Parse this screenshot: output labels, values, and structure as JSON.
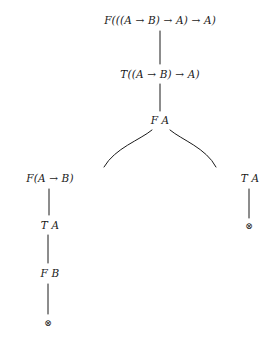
{
  "diagram": {
    "kind": "semantic-tableau-proof-tree",
    "background_color": "#ffffff",
    "line_color": "#1a1a1a",
    "text_color": "#1a1a1a",
    "closure_symbol": "⊗",
    "arrow_symbol": "→",
    "nodes": [
      {
        "id": "n1",
        "label": "F(((A → B) → A) → A)",
        "x": 160,
        "y": 20,
        "type": "formula"
      },
      {
        "id": "n2",
        "label": "T((A → B) → A)",
        "x": 160,
        "y": 74,
        "type": "formula"
      },
      {
        "id": "n3",
        "label": "F A",
        "x": 160,
        "y": 120,
        "type": "formula"
      },
      {
        "id": "n4",
        "label": "F(A → B)",
        "x": 50,
        "y": 178,
        "type": "formula"
      },
      {
        "id": "n5",
        "label": "T A",
        "x": 50,
        "y": 225,
        "type": "formula"
      },
      {
        "id": "n6",
        "label": "F B",
        "x": 50,
        "y": 273,
        "type": "formula"
      },
      {
        "id": "n7",
        "label": "⊗",
        "x": 48,
        "y": 323,
        "type": "closure"
      },
      {
        "id": "n8",
        "label": "T A",
        "x": 250,
        "y": 178,
        "type": "formula"
      },
      {
        "id": "n9",
        "label": "⊗",
        "x": 249,
        "y": 226,
        "type": "closure"
      }
    ],
    "edges": [
      {
        "from": "n1",
        "to": "n2",
        "shape": "straight",
        "x1": 160,
        "y1": 31,
        "x2": 160,
        "y2": 64
      },
      {
        "from": "n2",
        "to": "n3",
        "shape": "straight",
        "x1": 160,
        "y1": 84,
        "x2": 160,
        "y2": 111
      },
      {
        "from": "n3",
        "to": "n4",
        "shape": "curve",
        "d": "M 152 130 C 140 140, 115 148, 104 167"
      },
      {
        "from": "n3",
        "to": "n8",
        "shape": "curve",
        "d": "M 170 130 C 182 140, 206 148, 216 167"
      },
      {
        "from": "n4",
        "to": "n5",
        "shape": "straight",
        "x1": 49,
        "y1": 189,
        "x2": 49,
        "y2": 215
      },
      {
        "from": "n5",
        "to": "n6",
        "shape": "straight",
        "x1": 48,
        "y1": 235,
        "x2": 48,
        "y2": 263
      },
      {
        "from": "n6",
        "to": "n7",
        "shape": "straight",
        "x1": 48,
        "y1": 284,
        "x2": 48,
        "y2": 314
      },
      {
        "from": "n8",
        "to": "n9",
        "shape": "straight",
        "x1": 249,
        "y1": 189,
        "x2": 249,
        "y2": 218
      }
    ]
  }
}
